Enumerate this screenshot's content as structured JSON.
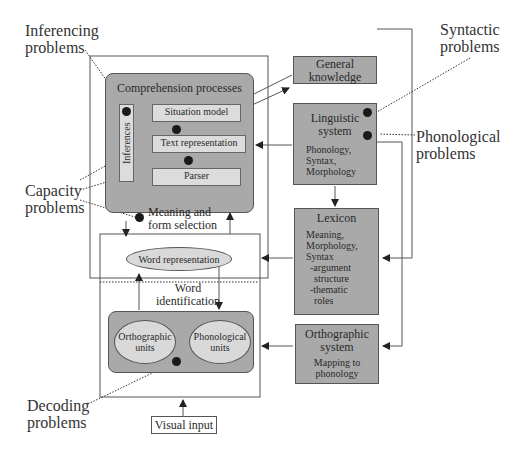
{
  "problems": {
    "inferencing": [
      "Inferencing",
      "problems"
    ],
    "syntactic": [
      "Syntactic",
      "problems"
    ],
    "phonological": [
      "Phonological",
      "problems"
    ],
    "capacity": [
      "Capacity",
      "problems"
    ],
    "decoding": [
      "Decoding",
      "problems"
    ]
  },
  "comprehension": {
    "title": "Comprehension processes",
    "inferences": "Inferences",
    "situation_model": "Situation model",
    "text_representation": "Text representation",
    "parser": "Parser"
  },
  "meaning_selection": [
    "Meaning and",
    "form selection"
  ],
  "word_identification": {
    "word_representation": "Word representation",
    "label": [
      "Word",
      "identification"
    ],
    "orthographic_units": [
      "Orthographic",
      "units"
    ],
    "phonological_units": [
      "Phonological",
      "units"
    ]
  },
  "visual_input": "Visual input",
  "general_knowledge": [
    "General",
    "knowledge"
  ],
  "linguistic_system": {
    "title": [
      "Linguistic",
      "system"
    ],
    "items": [
      "Phonology,",
      "Syntax,",
      "Morphology"
    ]
  },
  "lexicon": {
    "title": "Lexicon",
    "items": [
      "Meaning,",
      "Morphology,",
      "Syntax",
      "-argument",
      "structure",
      "-thematic",
      "roles"
    ]
  },
  "orthographic_system": {
    "title": [
      "Orthographic",
      "system"
    ],
    "items": [
      "Mapping to",
      "phonology"
    ]
  },
  "colors": {
    "dark_box": "#a9a9a9",
    "light_box": "#d6d6d6",
    "line": "#555555",
    "dot": "#1a1a1a"
  }
}
